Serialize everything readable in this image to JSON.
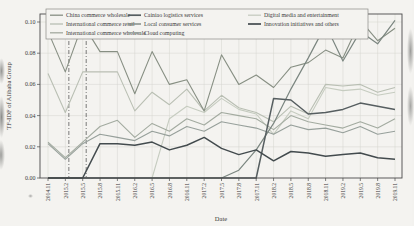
{
  "figure": {
    "title": "",
    "xlabel": "Date",
    "ylabel": "TF-IDF of Alibaba Group"
  },
  "chart_data": {
    "type": "line",
    "title": "",
    "xlabel": "Date",
    "ylabel": "TF-IDF of Alibaba Group",
    "ylim": [
      0.0,
      0.1
    ],
    "yticks": [
      0.0,
      0.02,
      0.04,
      0.06,
      0.08,
      0.1
    ],
    "grid": true,
    "legend": {
      "position": "upper-inside",
      "columns": [
        [
          "China commerce wholesale",
          "International commerce retail",
          "International commerce wholesale"
        ],
        [
          "Cainiao logistics services",
          "Local consumer services",
          "Cloud computing"
        ],
        [
          "Digital media and entertainment",
          "Innovation initiatives and others"
        ]
      ]
    },
    "event_lines": [
      {
        "x": "2015.2",
        "style": "dashdot"
      },
      {
        "x": "2015.5",
        "style": "dashdot"
      }
    ],
    "categories": [
      "2014.11",
      "2015.2",
      "2015.5",
      "2015.8",
      "2015.11",
      "2016.2",
      "2016.5",
      "2016.8",
      "2016.11",
      "2017.2",
      "2017.5",
      "2017.8",
      "2017.11",
      "2018.2",
      "2018.5",
      "2018.8",
      "2018.11",
      "2019.2",
      "2019.5",
      "2019.8",
      "2019.11"
    ],
    "series": [
      {
        "name": "China commerce wholesale",
        "color": "#878f83",
        "width": 1.1,
        "values": [
          0.094,
          0.068,
          0.099,
          0.081,
          0.081,
          0.054,
          0.081,
          0.06,
          0.063,
          0.043,
          0.079,
          0.06,
          0.066,
          0.058,
          0.071,
          0.074,
          0.082,
          0.077,
          0.101,
          0.088,
          0.096
        ]
      },
      {
        "name": "International commerce retail",
        "color": "#b9bfb3",
        "width": 1.1,
        "values": [
          0.067,
          0.042,
          0.068,
          0.068,
          0.068,
          0.043,
          0.055,
          0.047,
          0.057,
          0.043,
          0.053,
          0.045,
          0.042,
          0.036,
          0.046,
          0.041,
          0.06,
          0.059,
          0.06,
          0.055,
          0.058
        ]
      },
      {
        "name": "International commerce wholesale",
        "color": "#a3aba0",
        "width": 1.1,
        "values": [
          0.023,
          0.013,
          0.023,
          0.033,
          0.037,
          0.026,
          0.035,
          0.03,
          0.038,
          0.034,
          0.042,
          0.04,
          0.038,
          0.031,
          0.04,
          0.036,
          0.034,
          0.032,
          0.036,
          0.032,
          0.038
        ]
      },
      {
        "name": "Cainiao logistics services",
        "color": "#565e60",
        "width": 1.5,
        "values": [
          0,
          0,
          0,
          0,
          0,
          0,
          0,
          0,
          0,
          0,
          0,
          0,
          0,
          0.051,
          0.05,
          0.041,
          0.042,
          0.044,
          0.048,
          0.046,
          0.044
        ]
      },
      {
        "name": "Local consumer services",
        "color": "#7b8680",
        "width": 1.2,
        "values": [
          0,
          0,
          0,
          0,
          0,
          0,
          0,
          0,
          0,
          0,
          0,
          0.005,
          0.018,
          0.035,
          0.057,
          0.077,
          0.098,
          0.075,
          0.094,
          0.086,
          0.101
        ]
      },
      {
        "name": "Cloud computing",
        "color": "#97a09b",
        "width": 1.1,
        "values": [
          0.022,
          0.012,
          0.022,
          0.028,
          0.026,
          0.024,
          0.03,
          0.027,
          0.033,
          0.03,
          0.036,
          0.034,
          0.032,
          0.028,
          0.034,
          0.031,
          0.032,
          0.029,
          0.033,
          0.028,
          0.03
        ]
      },
      {
        "name": "Digital media and entertainment",
        "color": "#c6ccc0",
        "width": 1.1,
        "values": [
          0,
          0,
          0,
          0,
          0,
          0,
          0,
          0.038,
          0.046,
          0.042,
          0.051,
          0.044,
          0.041,
          0.028,
          0.043,
          0.038,
          0.058,
          0.056,
          0.057,
          0.053,
          0.055
        ]
      },
      {
        "name": "Innovation initiatives and others",
        "color": "#434b4e",
        "width": 1.5,
        "values": [
          0,
          0,
          0,
          0.022,
          0.022,
          0.021,
          0.023,
          0.018,
          0.021,
          0.026,
          0.019,
          0.015,
          0.018,
          0.011,
          0.017,
          0.016,
          0.014,
          0.015,
          0.016,
          0.013,
          0.012
        ]
      }
    ],
    "colors": {
      "grid": "#d4d4cf",
      "axis": "#4a4a4a",
      "event_line": "#5a5a5a",
      "paper": "#f4f3f0"
    }
  }
}
